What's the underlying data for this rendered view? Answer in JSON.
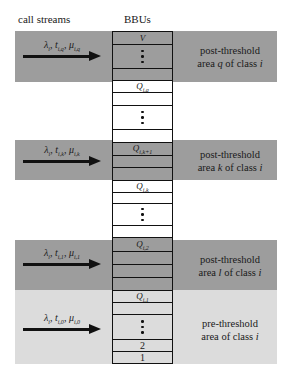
{
  "headers": {
    "left": "call streams",
    "center": "BBUs"
  },
  "colors": {
    "dark_band": "#9d9d9d",
    "light_band": "#dcdcdc",
    "cell_border": "#111111"
  },
  "bands": [
    {
      "type": "dark",
      "label_line1": "post-threshold",
      "label_line2_pre": "area ",
      "label_var": "q",
      "label_line2_post": " of class ",
      "label_class": "i",
      "arrow": {
        "lambda": "λ",
        "lambda_sub": "i",
        "t": "t",
        "t_sub": "i,q",
        "mu": "μ",
        "mu_sub": "i,q"
      }
    },
    {
      "type": "dark",
      "label_line1": "post-threshold",
      "label_line2_pre": "area ",
      "label_var": "k",
      "label_line2_post": " of class ",
      "label_class": "i",
      "arrow": {
        "lambda": "λ",
        "lambda_sub": "i",
        "t": "t",
        "t_sub": "i,k",
        "mu": "μ",
        "mu_sub": "i,k"
      }
    },
    {
      "type": "dark",
      "label_line1": "post-threshold",
      "label_line2_pre": "area ",
      "label_var": "l",
      "label_line2_post": " of class ",
      "label_class": "i",
      "arrow": {
        "lambda": "λ",
        "lambda_sub": "i",
        "t": "t",
        "t_sub": "i,1",
        "mu": "μ",
        "mu_sub": "i,1"
      }
    },
    {
      "type": "light",
      "label_line1": "pre-threshold",
      "label_line2_pre": "area of class ",
      "label_var": "",
      "label_line2_post": "",
      "label_class": "i",
      "arrow": {
        "lambda": "λ",
        "lambda_sub": "i",
        "t": "t",
        "t_sub": "i,0",
        "mu": "μ",
        "mu_sub": "i,0"
      }
    }
  ],
  "cells": {
    "V": "V",
    "Q_iq": {
      "main": "Q",
      "sub": "i,q"
    },
    "Q_ik1": {
      "main": "Q",
      "sub": "i,k+1"
    },
    "Q_ik": {
      "main": "Q",
      "sub": "i,k"
    },
    "Q_i2": {
      "main": "Q",
      "sub": "i,2"
    },
    "Q_i1": {
      "main": "Q",
      "sub": "i,1"
    },
    "two": "2",
    "one": "1"
  }
}
